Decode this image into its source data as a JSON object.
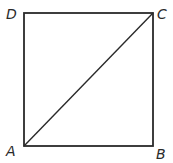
{
  "diagram": {
    "type": "geometry",
    "shape": "square",
    "stroke_color": "#2a2a2a",
    "background_color": "#ffffff",
    "vertices": [
      {
        "label": "A",
        "position": "bottom-left",
        "x": 24,
        "y": 146
      },
      {
        "label": "B",
        "position": "bottom-right",
        "x": 153,
        "y": 146
      },
      {
        "label": "C",
        "position": "top-right",
        "x": 153,
        "y": 13
      },
      {
        "label": "D",
        "position": "top-left",
        "x": 24,
        "y": 13
      }
    ],
    "segments": [
      {
        "from": "A",
        "to": "B",
        "kind": "side"
      },
      {
        "from": "B",
        "to": "C",
        "kind": "side"
      },
      {
        "from": "C",
        "to": "D",
        "kind": "side"
      },
      {
        "from": "D",
        "to": "A",
        "kind": "side"
      },
      {
        "from": "A",
        "to": "C",
        "kind": "diagonal"
      }
    ],
    "labels": {
      "a": "A",
      "b": "B",
      "c": "C",
      "d": "D"
    }
  }
}
